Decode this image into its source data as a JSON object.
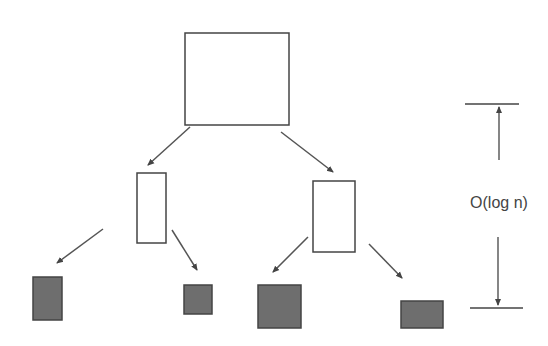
{
  "diagram": {
    "type": "tree",
    "colors": {
      "stroke": "#444444",
      "empty_fill": "#ffffff",
      "leaf_fill": "#6e6e6e",
      "arrow": "#555555",
      "background": "#ffffff"
    },
    "nodes": [
      {
        "id": "root",
        "level": 0,
        "filled": false,
        "x": 185,
        "y": 33,
        "w": 104,
        "h": 92
      },
      {
        "id": "left",
        "level": 1,
        "filled": false,
        "x": 137,
        "y": 173,
        "w": 29,
        "h": 70
      },
      {
        "id": "right",
        "level": 1,
        "filled": false,
        "x": 313,
        "y": 181,
        "w": 42,
        "h": 71
      },
      {
        "id": "leaf1",
        "level": 2,
        "filled": true,
        "x": 33,
        "y": 277,
        "w": 29,
        "h": 43
      },
      {
        "id": "leaf2",
        "level": 2,
        "filled": true,
        "x": 184,
        "y": 285,
        "w": 28,
        "h": 29
      },
      {
        "id": "leaf3",
        "level": 2,
        "filled": true,
        "x": 258,
        "y": 285,
        "w": 43,
        "h": 43
      },
      {
        "id": "leaf4",
        "level": 2,
        "filled": true,
        "x": 401,
        "y": 301,
        "w": 42,
        "h": 27
      }
    ],
    "edges": [
      {
        "from": "root",
        "to": "left",
        "x1": 190,
        "y1": 127,
        "x2": 148,
        "y2": 165
      },
      {
        "from": "root",
        "to": "right",
        "x1": 281,
        "y1": 132,
        "x2": 333,
        "y2": 172
      },
      {
        "from": "left",
        "to": "leaf1",
        "x1": 103,
        "y1": 229,
        "x2": 57,
        "y2": 263
      },
      {
        "from": "left",
        "to": "leaf2",
        "x1": 172,
        "y1": 230,
        "x2": 197,
        "y2": 270
      },
      {
        "from": "right",
        "to": "leaf3",
        "x1": 308,
        "y1": 237,
        "x2": 273,
        "y2": 272
      },
      {
        "from": "right",
        "to": "leaf4",
        "x1": 369,
        "y1": 244,
        "x2": 402,
        "y2": 278
      }
    ],
    "depth_marker": {
      "label": "O(log n)",
      "top_bar": {
        "x1": 465,
        "x2": 519,
        "y": 104
      },
      "bottom_bar": {
        "x1": 470,
        "x2": 523,
        "y": 308
      },
      "upper_arrow": {
        "x": 499,
        "y_from": 160,
        "y_to": 107
      },
      "lower_arrow": {
        "x": 498,
        "y_from": 237,
        "y_to": 305
      },
      "label_x": 499,
      "label_y": 208
    }
  }
}
